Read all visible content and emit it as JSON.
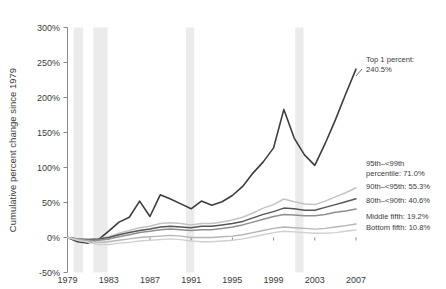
{
  "chart_data": {
    "type": "line",
    "title": "",
    "xlabel": "",
    "ylabel": "Cumulative percent change since 1979",
    "xlim": [
      1979,
      2007
    ],
    "ylim": [
      -50,
      300
    ],
    "ytick_labels": [
      "300%",
      "250%",
      "200%",
      "150%",
      "100%",
      "50%",
      "0%",
      "-50%"
    ],
    "ytick_values": [
      300,
      250,
      200,
      150,
      100,
      50,
      0,
      -50
    ],
    "xtick_labels": [
      "1979",
      "1983",
      "1987",
      "1991",
      "1995",
      "1999",
      "2003",
      "2007"
    ],
    "xtick_values": [
      1979,
      1983,
      1987,
      1991,
      1995,
      1999,
      2003,
      2007
    ],
    "grid": false,
    "legend_position": "right-inline-annotations",
    "recession_bands": [
      {
        "start": 1979.6,
        "end": 1980.5
      },
      {
        "start": 1981.5,
        "end": 1982.9
      },
      {
        "start": 1990.5,
        "end": 1991.3
      },
      {
        "start": 2001.1,
        "end": 2001.9
      }
    ],
    "x": [
      1979,
      1980,
      1981,
      1982,
      1983,
      1984,
      1985,
      1986,
      1987,
      1988,
      1989,
      1990,
      1991,
      1992,
      1993,
      1994,
      1995,
      1996,
      1997,
      1998,
      1999,
      2000,
      2001,
      2002,
      2003,
      2004,
      2005,
      2006,
      2007
    ],
    "series": [
      {
        "name": "Top 1 percent",
        "color": "#3d3d3d",
        "width": 1.6,
        "end_value": 240.5,
        "values": [
          0,
          -6,
          -8,
          -3,
          9,
          22,
          29,
          52,
          30,
          61,
          55,
          48,
          41,
          52,
          46,
          51,
          60,
          73,
          92,
          108,
          128,
          183,
          142,
          118,
          103,
          134,
          168,
          205,
          240.5
        ]
      },
      {
        "name": "95th–<99th percentile",
        "color": "#c3c3c3",
        "width": 1.5,
        "end_value": 71.0,
        "values": [
          0,
          -2,
          -3,
          -2,
          1,
          6,
          10,
          14,
          16,
          20,
          21,
          20,
          18,
          20,
          20,
          22,
          25,
          29,
          35,
          42,
          47,
          55,
          51,
          48,
          47,
          52,
          58,
          64,
          71.0
        ]
      },
      {
        "name": "90th–<95th",
        "color": "#555555",
        "width": 1.5,
        "end_value": 55.3,
        "values": [
          0,
          -2,
          -3,
          -2,
          0,
          4,
          7,
          10,
          12,
          15,
          16,
          15,
          14,
          16,
          16,
          18,
          20,
          23,
          28,
          33,
          37,
          42,
          41,
          39,
          39,
          43,
          47,
          51,
          55.3
        ]
      },
      {
        "name": "80th–<90th",
        "color": "#8f8f8f",
        "width": 1.5,
        "end_value": 40.6,
        "values": [
          0,
          -2,
          -4,
          -4,
          -2,
          1,
          4,
          7,
          9,
          11,
          12,
          11,
          10,
          11,
          11,
          13,
          15,
          18,
          22,
          26,
          30,
          33,
          32,
          31,
          31,
          33,
          36,
          38,
          40.6
        ]
      },
      {
        "name": "Middle fifth",
        "color": "#b5b5b5",
        "width": 1.4,
        "end_value": 19.2,
        "values": [
          0,
          -3,
          -5,
          -7,
          -6,
          -4,
          -2,
          0,
          1,
          2,
          3,
          2,
          0,
          0,
          0,
          1,
          2,
          4,
          7,
          10,
          13,
          15,
          14,
          13,
          12,
          13,
          15,
          17,
          19.2
        ]
      },
      {
        "name": "Bottom fifth",
        "color": "#d0d0d0",
        "width": 1.4,
        "end_value": 10.8,
        "values": [
          0,
          -4,
          -7,
          -10,
          -10,
          -8,
          -7,
          -5,
          -4,
          -3,
          -2,
          -3,
          -5,
          -6,
          -6,
          -5,
          -4,
          -2,
          1,
          4,
          7,
          9,
          8,
          7,
          6,
          6,
          7,
          9,
          10.8
        ]
      }
    ],
    "annotations": [
      {
        "id": "top1",
        "line1": "Top 1 percent:",
        "line2": "240.5%"
      },
      {
        "id": "p95",
        "line1": "95th–<99th",
        "line2": "percentile: 71.0%"
      },
      {
        "id": "p90",
        "line1": "90th–<95th: 55.3%",
        "line2": ""
      },
      {
        "id": "p80",
        "line1": "80th–<90th: 40.6%",
        "line2": ""
      },
      {
        "id": "mid",
        "line1": "Middle fifth: 19.2%",
        "line2": ""
      },
      {
        "id": "bot",
        "line1": "Bottom fifth: 10.8%",
        "line2": ""
      }
    ]
  }
}
